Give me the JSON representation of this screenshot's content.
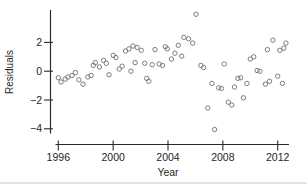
{
  "chart_data": {
    "type": "scatter",
    "title": "",
    "xlabel": "Year",
    "ylabel": "Residuals",
    "legend": null,
    "grid": false,
    "marker": "open-circle",
    "xlim": [
      1995.8,
      2012.85
    ],
    "ylim": [
      -4.5,
      4.25
    ],
    "x_ticks": [
      {
        "value": 1996,
        "label": "1996"
      },
      {
        "value": 2000,
        "label": "2000"
      },
      {
        "value": 2004,
        "label": "2004"
      },
      {
        "value": 2008,
        "label": "2008"
      },
      {
        "value": 2012,
        "label": "2012"
      }
    ],
    "y_ticks": [
      {
        "value": 2,
        "label": "2"
      },
      {
        "value": 0,
        "label": "0"
      },
      {
        "value": -2,
        "label": "−2"
      },
      {
        "value": -4,
        "label": "−4"
      }
    ],
    "colors": {
      "axis": "#2a2a2a",
      "tick_label": "#1f1f1f",
      "axis_title": "#1f1f1f",
      "marker_stroke": "#7d7d7d",
      "background": "#ffffff"
    },
    "points": [
      [
        1996.0,
        -0.45
      ],
      [
        1996.2,
        -0.75
      ],
      [
        1996.5,
        -0.55
      ],
      [
        1996.7,
        -0.4
      ],
      [
        1997.0,
        -0.3
      ],
      [
        1997.25,
        -0.1
      ],
      [
        1997.5,
        -0.6
      ],
      [
        1997.8,
        -0.9
      ],
      [
        1998.15,
        -0.4
      ],
      [
        1998.4,
        -0.3
      ],
      [
        1998.55,
        0.4
      ],
      [
        1998.7,
        0.6
      ],
      [
        1999.0,
        0.3
      ],
      [
        1999.3,
        0.75
      ],
      [
        1999.5,
        0.55
      ],
      [
        1999.7,
        -0.25
      ],
      [
        2000.0,
        1.1
      ],
      [
        2000.2,
        0.95
      ],
      [
        2000.45,
        0.15
      ],
      [
        2000.65,
        0.35
      ],
      [
        2000.9,
        1.4
      ],
      [
        2001.15,
        1.55
      ],
      [
        2001.3,
        0.0
      ],
      [
        2001.45,
        1.75
      ],
      [
        2001.6,
        0.6
      ],
      [
        2001.75,
        1.65
      ],
      [
        2002.05,
        1.45
      ],
      [
        2002.3,
        0.55
      ],
      [
        2002.45,
        -0.5
      ],
      [
        2002.6,
        -0.7
      ],
      [
        2002.85,
        0.45
      ],
      [
        2003.05,
        1.5
      ],
      [
        2003.35,
        0.5
      ],
      [
        2003.6,
        0.4
      ],
      [
        2003.8,
        1.7
      ],
      [
        2003.95,
        1.55
      ],
      [
        2004.25,
        0.85
      ],
      [
        2004.5,
        1.25
      ],
      [
        2004.75,
        1.8
      ],
      [
        2005.0,
        1.05
      ],
      [
        2005.15,
        2.35
      ],
      [
        2005.5,
        2.25
      ],
      [
        2005.8,
        1.95
      ],
      [
        2006.05,
        3.95
      ],
      [
        2006.4,
        0.4
      ],
      [
        2006.6,
        0.25
      ],
      [
        2006.9,
        -2.55
      ],
      [
        2007.2,
        -0.85
      ],
      [
        2007.4,
        -4.05
      ],
      [
        2007.7,
        -1.15
      ],
      [
        2007.9,
        -1.2
      ],
      [
        2008.1,
        0.5
      ],
      [
        2008.4,
        -2.15
      ],
      [
        2008.65,
        -2.35
      ],
      [
        2008.85,
        -1.1
      ],
      [
        2009.1,
        -0.5
      ],
      [
        2009.3,
        -0.45
      ],
      [
        2009.5,
        -1.85
      ],
      [
        2009.75,
        -0.85
      ],
      [
        2010.0,
        0.85
      ],
      [
        2010.25,
        1.0
      ],
      [
        2010.5,
        0.05
      ],
      [
        2010.7,
        0.0
      ],
      [
        2011.1,
        -0.9
      ],
      [
        2011.25,
        1.5
      ],
      [
        2011.4,
        -0.7
      ],
      [
        2011.65,
        2.15
      ],
      [
        2012.0,
        -0.35
      ],
      [
        2012.15,
        1.45
      ],
      [
        2012.35,
        -0.85
      ],
      [
        2012.45,
        1.6
      ],
      [
        2012.6,
        1.95
      ]
    ]
  }
}
